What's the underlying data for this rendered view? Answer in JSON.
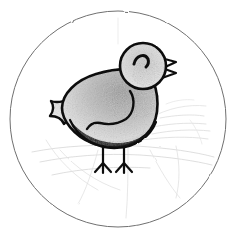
{
  "artwork": {
    "title": "Pencil sketch of a small bird in a circular frame",
    "medium": "graphite pencil drawing",
    "caption": "",
    "background_color": "#ffffff",
    "frame": {
      "shape": "circle",
      "stroke_color": "#6f6f6f",
      "stroke_width": 1,
      "center_x": 118,
      "center_y": 119,
      "radius": 108
    },
    "palette": {
      "ink_outline": "#111111",
      "belly_dark": "#1a1a1a",
      "body_shading_mid": "#b4b4b4",
      "body_shading_light": "#dcdcdc",
      "ground_sketch": "#cfcfcf",
      "frame_line": "#6f6f6f",
      "paper": "#ffffff"
    },
    "subject": {
      "name": "bird",
      "species_hint": "chick",
      "facing": "right",
      "parts": [
        {
          "name": "head",
          "shape": "circle",
          "cx": 143,
          "cy": 66,
          "r": 23
        },
        {
          "name": "eye",
          "shape": "curved arc",
          "cx": 140,
          "cy": 62
        },
        {
          "name": "beak",
          "shape": "open pointed triangle",
          "cx": 170,
          "cy": 68
        },
        {
          "name": "body",
          "shape": "rounded oval",
          "cx": 113,
          "cy": 110
        },
        {
          "name": "wing",
          "shape": "scalloped feather tail",
          "cx": 75,
          "cy": 105
        },
        {
          "name": "belly-band",
          "shape": "dark crescent",
          "cx": 115,
          "cy": 131
        },
        {
          "name": "left-leg",
          "shape": "thin line with three toes",
          "cx": 104,
          "cy": 155
        },
        {
          "name": "right-leg",
          "shape": "thin line with three toes",
          "cx": 123,
          "cy": 155
        }
      ]
    },
    "background_elements": [
      {
        "name": "ground-line",
        "description": "faint horizontal pencil ground line"
      },
      {
        "name": "shadow-sketch",
        "description": "faint diagonal shading to the right of the bird"
      },
      {
        "name": "construction-lines",
        "description": "light erased guide strokes across lower frame"
      }
    ]
  }
}
